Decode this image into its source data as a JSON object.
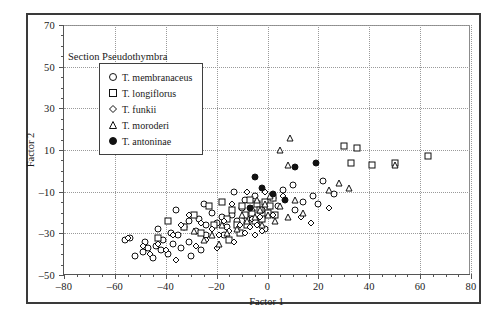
{
  "figure": {
    "section_title": "Section Pseudothymbra"
  },
  "axes": {
    "xlabel": "Factor 1",
    "ylabel": "Factor 2",
    "xticks": [
      -80,
      -60,
      -40,
      -20,
      0,
      20,
      40,
      60,
      80
    ],
    "yticks": [
      -50,
      -30,
      -10,
      10,
      30,
      50,
      70
    ],
    "xlim": [
      -80,
      80
    ],
    "ylim": [
      -50,
      70
    ]
  },
  "legend": {
    "items": [
      {
        "label": "T. membranaceus",
        "marker": "circle-open"
      },
      {
        "label": "T. longiflorus",
        "marker": "square-open"
      },
      {
        "label": "T. funkii",
        "marker": "diamond-open"
      },
      {
        "label": "T. moroderi",
        "marker": "triangle-open"
      },
      {
        "label": "T. antoninae",
        "marker": "circle-filled"
      }
    ]
  },
  "chart_data": {
    "type": "scatter",
    "title": "Section Pseudothymbra",
    "xlabel": "Factor 1",
    "ylabel": "Factor 2",
    "xlim": [
      -80,
      80
    ],
    "ylim": [
      -50,
      70
    ],
    "grid": true,
    "legend_position": "upper-left-inside",
    "series": [
      {
        "name": "T. membranaceus",
        "marker": "circle-open",
        "points": [
          [
            -56,
            -33
          ],
          [
            -54,
            -32
          ],
          [
            -52,
            -41
          ],
          [
            -49,
            -39
          ],
          [
            -47,
            -37
          ],
          [
            -45,
            -42
          ],
          [
            -44,
            -36
          ],
          [
            -42,
            -38
          ],
          [
            -41,
            -33
          ],
          [
            -39,
            -40
          ],
          [
            -38,
            -30
          ],
          [
            -37,
            -35
          ],
          [
            -35,
            -31
          ],
          [
            -34,
            -37
          ],
          [
            -33,
            -27
          ],
          [
            -31,
            -34
          ],
          [
            -30,
            -41
          ],
          [
            -28,
            -29
          ],
          [
            -26,
            -38
          ],
          [
            -24,
            -31
          ],
          [
            -36,
            -19
          ],
          [
            -31,
            -24
          ],
          [
            -27,
            -23
          ],
          [
            -24,
            -26
          ],
          [
            -22,
            -20
          ],
          [
            -20,
            -25
          ],
          [
            -18,
            -22
          ],
          [
            -16,
            -27
          ],
          [
            -14,
            -21
          ],
          [
            -12,
            -24
          ],
          [
            -10,
            -18
          ],
          [
            -8,
            -23
          ],
          [
            -6,
            -20
          ],
          [
            -4,
            -25
          ],
          [
            -2,
            -19
          ],
          [
            -13,
            -10
          ],
          [
            -9,
            -14
          ],
          [
            -5,
            -12
          ],
          [
            2,
            -13
          ],
          [
            6,
            -9
          ],
          [
            10,
            -7
          ],
          [
            14,
            -15
          ],
          [
            18,
            -12
          ],
          [
            22,
            -5
          ],
          [
            26,
            -11
          ],
          [
            20,
            -16
          ],
          [
            11,
            -19
          ],
          [
            4,
            -17
          ],
          [
            -1,
            -28
          ],
          [
            -17,
            -31
          ],
          [
            -43,
            -28
          ],
          [
            -48,
            -34
          ],
          [
            -25,
            -16
          ]
        ]
      },
      {
        "name": "T. longiflorus",
        "marker": "square-open",
        "points": [
          [
            -39,
            -24
          ],
          [
            -33,
            -27
          ],
          [
            -29,
            -21
          ],
          [
            -26,
            -30
          ],
          [
            -23,
            -17
          ],
          [
            -21,
            -26
          ],
          [
            -18,
            -15
          ],
          [
            -16,
            -23
          ],
          [
            -14,
            -19
          ],
          [
            -12,
            -26
          ],
          [
            -10,
            -17
          ],
          [
            -9,
            -21
          ],
          [
            -7,
            -14
          ],
          [
            -6,
            -20
          ],
          [
            -5,
            -24
          ],
          [
            -4,
            -16
          ],
          [
            -3,
            -19
          ],
          [
            -2,
            -23
          ],
          [
            -1,
            -15
          ],
          [
            0,
            -20
          ],
          [
            1,
            -17
          ],
          [
            2,
            -13
          ],
          [
            3,
            -21
          ],
          [
            -8,
            -26
          ],
          [
            -11,
            -30
          ],
          [
            -15,
            -33
          ],
          [
            30,
            12
          ],
          [
            35,
            11
          ],
          [
            33,
            4
          ],
          [
            41,
            3
          ],
          [
            50,
            4
          ],
          [
            63,
            7
          ],
          [
            -43,
            -32
          ]
        ]
      },
      {
        "name": "T. funkii",
        "marker": "diamond-open",
        "points": [
          [
            -55,
            -32
          ],
          [
            -49,
            -36
          ],
          [
            -46,
            -40
          ],
          [
            -43,
            -35
          ],
          [
            -40,
            -38
          ],
          [
            -37,
            -31
          ],
          [
            -34,
            -26
          ],
          [
            -31,
            -21
          ],
          [
            -28,
            -36
          ],
          [
            -26,
            -25
          ],
          [
            -24,
            -33
          ],
          [
            -22,
            -28
          ],
          [
            -19,
            -31
          ],
          [
            -17,
            -24
          ],
          [
            -15,
            -29
          ],
          [
            -13,
            -34
          ],
          [
            -11,
            -26
          ],
          [
            -9,
            -30
          ],
          [
            -7,
            -27
          ],
          [
            -6,
            -23
          ],
          [
            -5,
            -31
          ],
          [
            -4,
            -26
          ],
          [
            -3,
            -22
          ],
          [
            -2,
            -29
          ],
          [
            -14,
            -16
          ],
          [
            -8,
            -10
          ],
          [
            -1,
            -10
          ],
          [
            6,
            -12
          ],
          [
            13,
            -22
          ],
          [
            17,
            -25
          ],
          [
            24,
            -18
          ],
          [
            2,
            -21
          ],
          [
            -20,
            -37
          ],
          [
            -36,
            -43
          ]
        ]
      },
      {
        "name": "T. moroderi",
        "marker": "triangle-open",
        "points": [
          [
            -25,
            -33
          ],
          [
            -22,
            -31
          ],
          [
            -19,
            -35
          ],
          [
            -16,
            -30
          ],
          [
            -12,
            -28
          ],
          [
            -10,
            -21
          ],
          [
            -8,
            -24
          ],
          [
            -6,
            -18
          ],
          [
            -5,
            -22
          ],
          [
            -4,
            -14
          ],
          [
            -3,
            -19
          ],
          [
            -2,
            -26
          ],
          [
            -1,
            -16
          ],
          [
            0,
            -21
          ],
          [
            1,
            -12
          ],
          [
            3,
            -24
          ],
          [
            5,
            -17
          ],
          [
            8,
            -22
          ],
          [
            11,
            -14
          ],
          [
            14,
            -20
          ],
          [
            5,
            10
          ],
          [
            9,
            16
          ],
          [
            8,
            3
          ],
          [
            24,
            -9
          ],
          [
            28,
            -6
          ],
          [
            -18,
            -26
          ],
          [
            -29,
            -29
          ],
          [
            50,
            3
          ],
          [
            32,
            -8
          ]
        ]
      },
      {
        "name": "T. antoninae",
        "marker": "circle-filled",
        "points": [
          [
            -5,
            -3
          ],
          [
            -2,
            -8
          ],
          [
            2,
            -11
          ],
          [
            11,
            2
          ],
          [
            19,
            4
          ],
          [
            7,
            -14
          ],
          [
            -7,
            -18
          ]
        ]
      }
    ]
  }
}
